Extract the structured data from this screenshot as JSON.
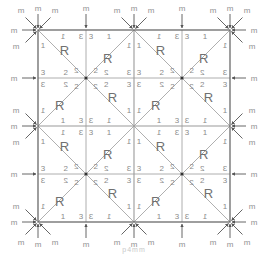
{
  "figure": {
    "type": "wallpaper-group-symmetry",
    "caption": "p4mm",
    "motif_letter": "R",
    "mirror_label": "m",
    "colors": {
      "grid_line": "#9a9a9a",
      "outer_border": "#6a6a6a",
      "text": "#8a8a8a",
      "motif": "#707070",
      "arrow": "#555555",
      "label": "#909090"
    },
    "grid": {
      "left": 38,
      "top": 30,
      "size": 192,
      "quadrants": 2
    },
    "cell_numbers": [
      "1",
      "2",
      "3"
    ],
    "mirror_arrows": {
      "top": [
        "m",
        "m",
        "m",
        "m",
        "m",
        "m",
        "m",
        "m",
        "m"
      ],
      "bottom": [
        "m",
        "m",
        "m",
        "m",
        "m",
        "m",
        "m",
        "m",
        "m"
      ],
      "left": [
        "m",
        "m",
        "m",
        "m",
        "m",
        "m",
        "m",
        "m",
        "m"
      ],
      "right": [
        "m",
        "m",
        "m",
        "m",
        "m",
        "m",
        "m",
        "m",
        "m"
      ]
    }
  }
}
